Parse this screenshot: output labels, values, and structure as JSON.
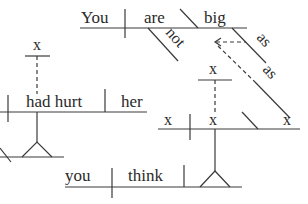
{
  "diagram": {
    "type": "Reed-Kellogg sentence diagram",
    "colors": {
      "ink": "#2a2a2a",
      "background": "#ffffff"
    },
    "main_clause": {
      "subject": "You",
      "verb": "are",
      "modifier": "not",
      "predicate_adjective": "big",
      "adverb_1": "as",
      "adverb_2": "as"
    },
    "subordinate_clause": {
      "subject": "x",
      "placeholder_x1": "x",
      "placeholder_x2": "x",
      "placeholder_x3": "x"
    },
    "left_clause": {
      "subject_placeholder": "x",
      "verb": "had hurt",
      "object": "her"
    },
    "bottom_clause": {
      "subject": "you",
      "verb": "think"
    }
  }
}
